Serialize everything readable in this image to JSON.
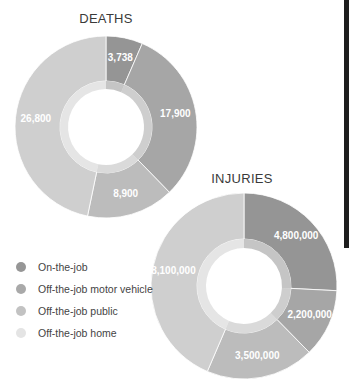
{
  "chart_data": [
    {
      "type": "pie",
      "variant": "donut",
      "title": "DEATHS",
      "categories": [
        "On-the-job",
        "Off-the-job motor vehicle",
        "Off-the-job public",
        "Off-the-job home"
      ],
      "values": [
        3738,
        17900,
        8900,
        26800
      ],
      "labels": [
        "3,738",
        "17,900",
        "8,900",
        "26,800"
      ],
      "center": [
        106,
        127
      ],
      "outer_radius": 91,
      "inner_band_radius": 46,
      "hole_radius": 38
    },
    {
      "type": "pie",
      "variant": "donut",
      "title": "INJURIES",
      "categories": [
        "On-the-job",
        "Off-the-job motor vehicle",
        "Off-the-job public",
        "Off-the-job home"
      ],
      "values": [
        4800000,
        2200000,
        3500000,
        8100000
      ],
      "labels": [
        "4,800,000",
        "2,200,000",
        "3,500,000",
        "8,100,000"
      ],
      "center": [
        244,
        286
      ],
      "outer_radius": 93,
      "inner_band_radius": 47,
      "hole_radius": 38
    }
  ],
  "legend": {
    "items": [
      {
        "label": "On-the-job",
        "color": "#969696"
      },
      {
        "label": "Off-the-job motor vehicle",
        "color": "#a9a9a9"
      },
      {
        "label": "Off-the-job public",
        "color": "#c2c2c2"
      },
      {
        "label": "Off-the-job home",
        "color": "#e4e4e4"
      }
    ]
  },
  "slice_colors": [
    "#959595",
    "#a6a6a6",
    "#bcbcbc",
    "#cfcfcf"
  ],
  "titles": {
    "deaths": "DEATHS",
    "injuries": "INJURIES"
  }
}
